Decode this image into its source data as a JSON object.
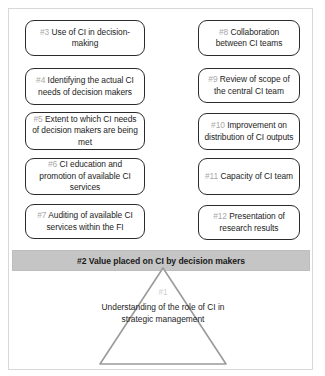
{
  "diagram": {
    "colors": {
      "box_border": "#2b2b2b",
      "band_fill": "#c5c5c5",
      "number_gray": "#a9a9a9",
      "frame_border": "#d8d8d8",
      "triangle_stroke": "#9a9a9a",
      "text": "#1d1d1d"
    },
    "left_column": [
      {
        "number": "#3",
        "text": "Use of CI in decision-making"
      },
      {
        "number": "#4",
        "text": "Identifying the actual CI needs of decision makers"
      },
      {
        "number": "#5",
        "text": "Extent to which CI needs of decision makers are being met"
      },
      {
        "number": "#6",
        "text": "CI education and promotion of available CI services"
      },
      {
        "number": "#7",
        "text": "Auditing of available CI services within the FI"
      }
    ],
    "right_column": [
      {
        "number": "#8",
        "text": "Collaboration between CI teams"
      },
      {
        "number": "#9",
        "text": "Review of scope of the central CI team"
      },
      {
        "number": "#10",
        "text": "Improvement on distribution of CI outputs"
      },
      {
        "number": "#11",
        "text": "Capacity of CI team"
      },
      {
        "number": "#12",
        "text": "Presentation of research results"
      }
    ],
    "value_band": {
      "label": "#2 Value placed on CI by decision makers"
    },
    "foundation": {
      "number": "#1",
      "text": "Understanding of the role of CI in strategic management"
    }
  }
}
